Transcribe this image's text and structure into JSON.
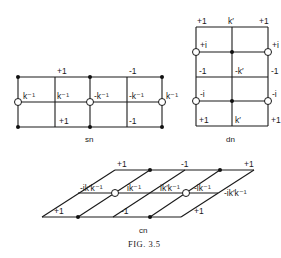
{
  "figure": {
    "caption": "Fig. 3.5",
    "caption_display": "FIG. 3.5"
  },
  "sn": {
    "label": "sn",
    "top_labels": [
      "+1",
      "-1"
    ],
    "middle_labels": [
      "k⁻¹",
      "k⁻¹",
      "-k⁻¹",
      "-k⁻¹",
      "k⁻¹"
    ],
    "bottom_labels": [
      "+1",
      "-1"
    ]
  },
  "dn": {
    "label": "dn",
    "row1": [
      "+1",
      "k′",
      "+1"
    ],
    "row2": [
      "+i",
      "+i"
    ],
    "row3": [
      "-1",
      "-k′",
      "-1"
    ],
    "row4": [
      "-i",
      "-i"
    ],
    "row5": [
      "+1",
      "k′",
      "+1"
    ]
  },
  "cn": {
    "label": "cn",
    "top_labels": [
      "+1",
      "-1",
      "+1"
    ],
    "middle_labels": [
      "-ik′k⁻¹",
      "ik⁻¹",
      "ik′k⁻¹",
      "-ik⁻¹",
      "-ik′k⁻¹"
    ],
    "bottom_labels": [
      "+1",
      "-1",
      "+1"
    ]
  }
}
